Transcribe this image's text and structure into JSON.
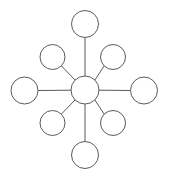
{
  "diagram": {
    "type": "node-link-graph",
    "topology": "star",
    "canvas": {
      "width": 169,
      "height": 178,
      "background": "#ffffff"
    },
    "style": {
      "node_fill": "#ffffff",
      "node_stroke": "#5a5a5a",
      "node_stroke_width": 1,
      "edge_stroke": "#5a5a5a",
      "edge_stroke_width": 1
    },
    "node_count": 9,
    "edge_count": 8,
    "nodes": [
      {
        "id": "hub",
        "role": "hub",
        "label": "",
        "cx": 85,
        "cy": 90,
        "r": 14
      },
      {
        "id": "spoke-n",
        "role": "spoke",
        "label": "",
        "cx": 85,
        "cy": 24,
        "r": 13.5
      },
      {
        "id": "spoke-ne",
        "role": "spoke",
        "label": "",
        "cx": 113,
        "cy": 57,
        "r": 12.5
      },
      {
        "id": "spoke-e",
        "role": "spoke",
        "label": "",
        "cx": 144,
        "cy": 90.5,
        "r": 13.5
      },
      {
        "id": "spoke-se",
        "role": "spoke",
        "label": "",
        "cx": 113,
        "cy": 123,
        "r": 12.5
      },
      {
        "id": "spoke-s",
        "role": "spoke",
        "label": "",
        "cx": 85,
        "cy": 155,
        "r": 13.5
      },
      {
        "id": "spoke-sw",
        "role": "spoke",
        "label": "",
        "cx": 52.5,
        "cy": 123,
        "r": 12.5
      },
      {
        "id": "spoke-w",
        "role": "spoke",
        "label": "",
        "cx": 24.5,
        "cy": 90.5,
        "r": 13.5
      },
      {
        "id": "spoke-nw",
        "role": "spoke",
        "label": "",
        "cx": 52.5,
        "cy": 57,
        "r": 12.5
      }
    ],
    "edges": [
      {
        "id": "edge-hub-n",
        "from": "hub",
        "to": "spoke-n",
        "x1": 85,
        "y1": 76,
        "x2": 85,
        "y2": 37.5
      },
      {
        "id": "edge-hub-ne",
        "from": "hub",
        "to": "spoke-ne",
        "x1": 94.9,
        "y1": 80.1,
        "x2": 104.1,
        "y2": 65.9
      },
      {
        "id": "edge-hub-e",
        "from": "hub",
        "to": "spoke-e",
        "x1": 99,
        "y1": 90.2,
        "x2": 130.5,
        "y2": 90.5
      },
      {
        "id": "edge-hub-se",
        "from": "hub",
        "to": "spoke-se",
        "x1": 94.9,
        "y1": 99.9,
        "x2": 104.1,
        "y2": 114.1
      },
      {
        "id": "edge-hub-s",
        "from": "hub",
        "to": "spoke-s",
        "x1": 85,
        "y1": 104,
        "x2": 85,
        "y2": 141.5
      },
      {
        "id": "edge-hub-sw",
        "from": "hub",
        "to": "spoke-sw",
        "x1": 75.1,
        "y1": 99.9,
        "x2": 61.4,
        "y2": 114.1
      },
      {
        "id": "edge-hub-w",
        "from": "hub",
        "to": "spoke-w",
        "x1": 71,
        "y1": 90.2,
        "x2": 38,
        "y2": 90.5
      },
      {
        "id": "edge-hub-nw",
        "from": "hub",
        "to": "spoke-nw",
        "x1": 75.1,
        "y1": 80.1,
        "x2": 61.4,
        "y2": 65.9
      }
    ]
  }
}
